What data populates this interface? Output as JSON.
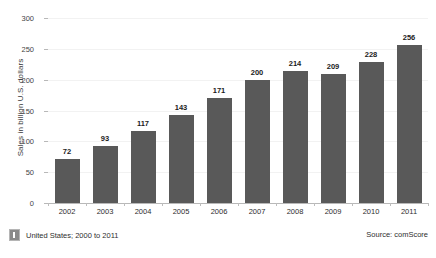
{
  "chart_data": {
    "type": "bar",
    "title": "",
    "subtitle": "",
    "xlabel": "",
    "ylabel": "Sales in billion U.S. dollars",
    "categories": [
      "2002",
      "2003",
      "2004",
      "2005",
      "2006",
      "2007",
      "2008",
      "2009",
      "2010",
      "2011"
    ],
    "values": [
      72,
      93,
      117,
      143,
      171,
      200,
      214,
      209,
      228,
      256
    ],
    "ylim": [
      0,
      300
    ],
    "yticks": [
      0,
      50,
      100,
      150,
      200,
      250,
      300
    ],
    "ytick_labels": [
      "0",
      "50",
      "100",
      "150",
      "200",
      "250",
      "300"
    ],
    "grid": true,
    "legend": "none",
    "bar_color": "#595959",
    "data_labels": [
      "72",
      "93",
      "117",
      "143",
      "171",
      "200",
      "214",
      "209",
      "228",
      "256"
    ]
  },
  "footer": {
    "note_icon": "info-icon",
    "note": "United States; 2000 to 2011",
    "source": "Source: comScore"
  }
}
